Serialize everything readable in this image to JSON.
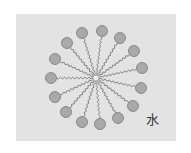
{
  "diagram": {
    "label": "水",
    "center": [
      96,
      78
    ],
    "head_radius": 5.5,
    "colors": {
      "background": "#e3e3e3",
      "head_fill": "#a9a9a9",
      "head_stroke": "#7a7a7a",
      "tail": "#6e6e6e"
    },
    "heads": [
      [
        82,
        33
      ],
      [
        102,
        31
      ],
      [
        120,
        38
      ],
      [
        134,
        51
      ],
      [
        142,
        68
      ],
      [
        141,
        88
      ],
      [
        133,
        106
      ],
      [
        118,
        118
      ],
      [
        100,
        124
      ],
      [
        82,
        122
      ],
      [
        66,
        112
      ],
      [
        55,
        97
      ],
      [
        51,
        78
      ],
      [
        55,
        59
      ],
      [
        67,
        43
      ]
    ]
  }
}
